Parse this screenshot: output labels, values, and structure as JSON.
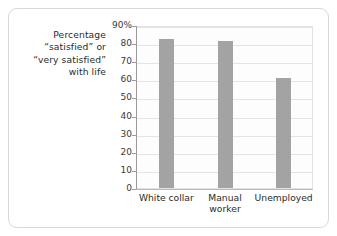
{
  "figure": {
    "background_color": "#ffffff",
    "frame_border_color": "#d8d8d8"
  },
  "caption": {
    "lines": [
      "Percentage",
      "“satisfied” or",
      "“very satisfied”",
      "with life"
    ]
  },
  "chart_data": {
    "type": "bar",
    "title": "",
    "subtitle": "",
    "xlabel": "",
    "ylabel": "Percentage “satisfied” or “very satisfied” with life",
    "categories": [
      "White collar",
      "Manual worker",
      "Unemployed"
    ],
    "category_lines": [
      [
        "White collar"
      ],
      [
        "Manual",
        "worker"
      ],
      [
        "Unemployed"
      ]
    ],
    "values": [
      82,
      81,
      61
    ],
    "ylim": [
      0,
      90
    ],
    "ytick_values": [
      90,
      80,
      70,
      60,
      50,
      40,
      30,
      20,
      10,
      0
    ],
    "ytick_labels": [
      "90%",
      "80",
      "70",
      "60",
      "50",
      "40",
      "30",
      "20",
      "10",
      "0"
    ],
    "grid": true,
    "grid_axis": "y",
    "legend": false,
    "legend_position": "none",
    "bar_color": "#a3a3a3",
    "gridline_color": "#e4e4e4",
    "axis_color": "#9a9a9a",
    "plot_background": "#fdfdfd"
  }
}
